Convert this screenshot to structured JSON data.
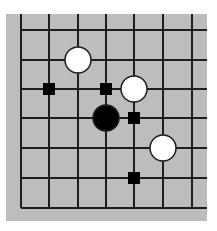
{
  "diagram": {
    "type": "go-board-fragment",
    "colors": {
      "page_background": "#ffffff",
      "board": "#bdbdbd",
      "grid_line": "#1e1e1e",
      "black_stone": "#000000",
      "white_stone": "#ffffff",
      "stone_outline": "#1e1e1e",
      "marker": "#000000"
    },
    "board_area": {
      "x": 6,
      "y": 14,
      "width": 201,
      "height": 207
    },
    "grid": {
      "x_lines": [
        21,
        49,
        78,
        106,
        134,
        163,
        192
      ],
      "y_lines": [
        30,
        60,
        89,
        118,
        148,
        178,
        208
      ],
      "edges": [
        "left",
        "bottom"
      ],
      "open_top_y": 14,
      "open_right_x": 207
    },
    "stones": [
      {
        "color": "white",
        "col": 2,
        "row": 1
      },
      {
        "color": "white",
        "col": 4,
        "row": 2
      },
      {
        "color": "black",
        "col": 3,
        "row": 3
      },
      {
        "color": "white",
        "col": 5,
        "row": 4
      }
    ],
    "markers": [
      {
        "shape": "square",
        "col": 1,
        "row": 2
      },
      {
        "shape": "square",
        "col": 3,
        "row": 2
      },
      {
        "shape": "square",
        "col": 4,
        "row": 3
      },
      {
        "shape": "square",
        "col": 4,
        "row": 5
      }
    ],
    "stone_radius": 13,
    "marker_size": 12
  }
}
